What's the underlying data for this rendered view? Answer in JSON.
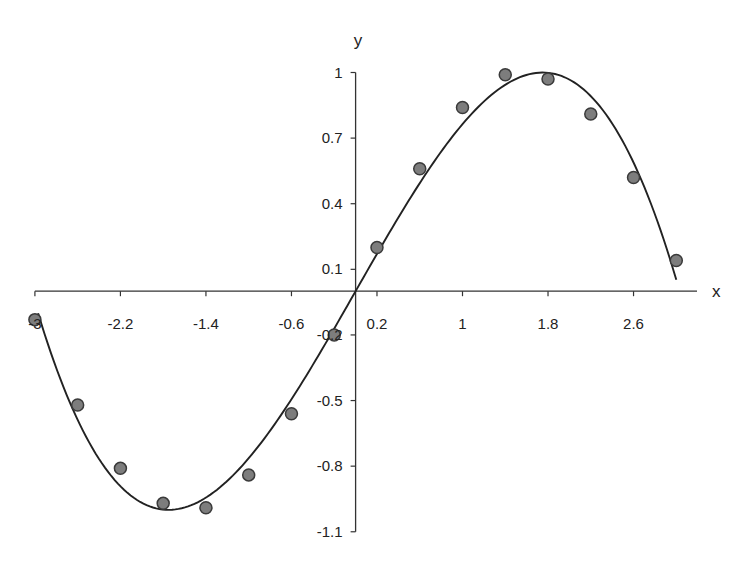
{
  "chart_data": {
    "type": "scatter",
    "title": "",
    "xlabel": "x",
    "ylabel": "y",
    "xlim": [
      -3.0,
      3.2
    ],
    "ylim": [
      -1.1,
      1.0
    ],
    "grid": false,
    "legend": null,
    "x_ticks": [
      -3.0,
      -2.2,
      -1.4,
      -0.6,
      0.2,
      1,
      1.8,
      2.6
    ],
    "x_tick_labels": [
      "-3",
      "-2.2",
      "-1.4",
      "-0.6",
      "0.2",
      "1",
      "1.8",
      "2.6"
    ],
    "y_ticks": [
      1,
      0.7,
      0.4,
      0.1,
      -0.2,
      -0.5,
      -0.8,
      -1.1
    ],
    "y_tick_labels": [
      "1",
      "0.7",
      "0.4",
      "0.1",
      "-0.2",
      "-0.5",
      "-0.8",
      "-1.1"
    ],
    "series": [
      {
        "name": "data points",
        "kind": "scatter",
        "x": [
          -3.0,
          -2.6,
          -2.2,
          -1.8,
          -1.4,
          -1.0,
          -0.6,
          -0.2,
          0.2,
          0.6,
          1.0,
          1.4,
          1.8,
          2.2,
          2.6,
          3.0
        ],
        "y": [
          -0.13,
          -0.52,
          -0.81,
          -0.97,
          -0.99,
          -0.84,
          -0.56,
          -0.2,
          0.2,
          0.56,
          0.84,
          0.99,
          0.97,
          0.81,
          0.52,
          0.14
        ]
      },
      {
        "name": "fitted curve",
        "kind": "line",
        "model": "y = 0.857x - 0.0933x^3",
        "x_range": [
          -2.97,
          3.0
        ]
      }
    ]
  },
  "colors": {
    "axis": "#333333",
    "curve": "#222222",
    "point_fill": "#7d7d7d",
    "point_stroke": "#3a3a3a",
    "text": "#222222"
  }
}
